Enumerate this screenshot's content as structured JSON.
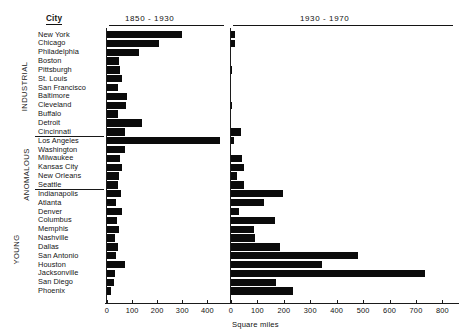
{
  "figure": {
    "city_column_header": "City",
    "axis_caption": "Square miles",
    "groups": [
      {
        "name": "INDUSTRIAL",
        "label": "INDUSTRIAL"
      },
      {
        "name": "ANOMALOUS",
        "label": "ANOMALOUS"
      },
      {
        "name": "YOUNG",
        "label": "YOUNG"
      }
    ]
  },
  "chart_data": {
    "type": "bar",
    "orientation": "horizontal",
    "title": "",
    "xlabel": "Square miles",
    "ylabel": "City",
    "grid": false,
    "legend": "none",
    "panels": [
      {
        "name": "panel-1850-1930",
        "title": "1850 - 1930",
        "xlim": [
          0,
          470
        ],
        "xticks": [
          0,
          100,
          200,
          300,
          400
        ],
        "xticklabels": [
          "0",
          "100",
          "200",
          "300",
          "400"
        ]
      },
      {
        "name": "panel-1930-1970",
        "title": "1930 - 1970",
        "xlim": [
          0,
          840
        ],
        "xticks": [
          0,
          100,
          200,
          300,
          400,
          500,
          600,
          700,
          800
        ],
        "xticklabels": [
          "0",
          "100",
          "200",
          "300",
          "400",
          "500",
          "600",
          "700",
          "800"
        ]
      }
    ],
    "categories": [
      "New York",
      "Chicago",
      "Philadelphia",
      "Boston",
      "Pittsburgh",
      "St. Louis",
      "San Francisco",
      "Baltimore",
      "Cleveland",
      "Buffalo",
      "Detroit",
      "Cincinnati",
      "Los Angeles",
      "Washington",
      "Milwaukee",
      "Kansas City",
      "New Orleans",
      "Seattle",
      "Indianapolis",
      "Atlanta",
      "Denver",
      "Columbus",
      "Memphis",
      "Nashville",
      "Dallas",
      "San Antonio",
      "Houston",
      "Jacksonville",
      "San Diego",
      "Phoenix"
    ],
    "category_groups": [
      "INDUSTRIAL",
      "INDUSTRIAL",
      "INDUSTRIAL",
      "INDUSTRIAL",
      "INDUSTRIAL",
      "INDUSTRIAL",
      "INDUSTRIAL",
      "INDUSTRIAL",
      "INDUSTRIAL",
      "INDUSTRIAL",
      "INDUSTRIAL",
      "INDUSTRIAL",
      "ANOMALOUS",
      "ANOMALOUS",
      "ANOMALOUS",
      "ANOMALOUS",
      "ANOMALOUS",
      "ANOMALOUS",
      "YOUNG",
      "YOUNG",
      "YOUNG",
      "YOUNG",
      "YOUNG",
      "YOUNG",
      "YOUNG",
      "YOUNG",
      "YOUNG",
      "YOUNG",
      "YOUNG",
      "YOUNG"
    ],
    "series": [
      {
        "name": "1850 - 1930",
        "panel": "panel-1850-1930",
        "values": [
          299,
          208,
          128,
          48,
          52,
          61,
          45,
          79,
          75,
          42,
          139,
          72,
          451,
          70,
          50,
          60,
          48,
          44,
          55,
          34,
          58,
          39,
          48,
          30,
          45,
          36,
          73,
          30,
          27,
          17
        ]
      },
      {
        "name": "1930 - 1970",
        "panel": "panel-1930-1970",
        "values": [
          16,
          16,
          0,
          0,
          3,
          0,
          0,
          0,
          4,
          0,
          0,
          36,
          12,
          0,
          41,
          49,
          22,
          49,
          198,
          123,
          32,
          168,
          87,
          92,
          185,
          480,
          345,
          733,
          170,
          235
        ]
      }
    ]
  }
}
